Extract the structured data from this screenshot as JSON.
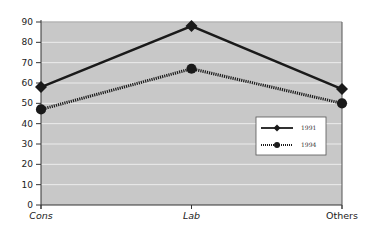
{
  "chart_data": {
    "type": "line",
    "title": "",
    "xlabel": "",
    "ylabel": "",
    "categories": [
      "Cons",
      "Lab",
      "Others"
    ],
    "category_styles": [
      "italic",
      "italic",
      "normal"
    ],
    "ylim": [
      0,
      90
    ],
    "yticks": [
      0,
      10,
      20,
      30,
      40,
      50,
      60,
      70,
      80,
      90
    ],
    "grid": true,
    "legend_position": "center-right",
    "series": [
      {
        "name": "1991",
        "values": [
          58,
          88,
          57
        ],
        "marker": "diamond",
        "line_style": "solid",
        "color": "#1a1a1a"
      },
      {
        "name": "1994",
        "values": [
          47,
          67,
          50
        ],
        "marker": "circle",
        "line_style": "dotted",
        "color": "#1a1a1a"
      }
    ],
    "colors": {
      "plot_background": "#c8c8c8",
      "gridline": "#ececec",
      "axis": "#333333"
    }
  }
}
